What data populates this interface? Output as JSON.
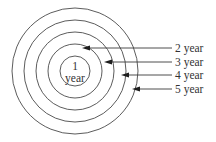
{
  "diagram": {
    "type": "concentric-rings",
    "center": {
      "x": 75,
      "y": 71
    },
    "rings": [
      {
        "radius": 15,
        "label": "1 year"
      },
      {
        "radius": 27,
        "label": "2 year"
      },
      {
        "radius": 39,
        "label": "3 year"
      },
      {
        "radius": 51,
        "label": "4 year"
      },
      {
        "radius": 63,
        "label": "5 year"
      }
    ],
    "center_label": {
      "line1": "1",
      "line2": "year"
    },
    "callouts": [
      {
        "label": "2 year",
        "tip_x": 82,
        "y": 48
      },
      {
        "label": "3 year",
        "tip_x": 104,
        "y": 62
      },
      {
        "label": "4 year",
        "tip_x": 121,
        "y": 75
      },
      {
        "label": "5 year",
        "tip_x": 132,
        "y": 89
      }
    ],
    "callout_line_end_x": 172,
    "label_x": 175,
    "colors": {
      "ring": "#4a4a4a",
      "arrow": "#1e1e1e",
      "text": "#333333",
      "background": "#ffffff"
    }
  }
}
